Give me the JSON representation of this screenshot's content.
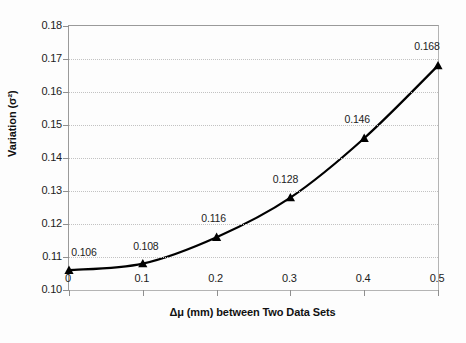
{
  "chart_data": {
    "type": "line",
    "title": "",
    "xlabel": "Δμ (mm) between Two Data Sets",
    "ylabel": "Variation (σ²)",
    "x": [
      0,
      0.1,
      0.2,
      0.3,
      0.4,
      0.5
    ],
    "values": [
      0.106,
      0.108,
      0.116,
      0.128,
      0.146,
      0.168
    ],
    "point_labels": [
      "0.106",
      "0.108",
      "0.116",
      "0.128",
      "0.146",
      "0.168"
    ],
    "xlim": [
      0,
      0.5
    ],
    "ylim": [
      0.1,
      0.18
    ],
    "xticks": [
      "0",
      "0.1",
      "0.2",
      "0.3",
      "0.4",
      "0.5"
    ],
    "yticks": [
      "0.10",
      "0.11",
      "0.12",
      "0.13",
      "0.14",
      "0.15",
      "0.16",
      "0.17",
      "0.18"
    ],
    "grid": "horizontal-dotted",
    "legend": "none",
    "marker": "filled-triangle",
    "line_color": "#000000",
    "grid_color": "#c2c2c2",
    "axis_color": "#9a9a9a",
    "background_color": "#ffffff"
  }
}
